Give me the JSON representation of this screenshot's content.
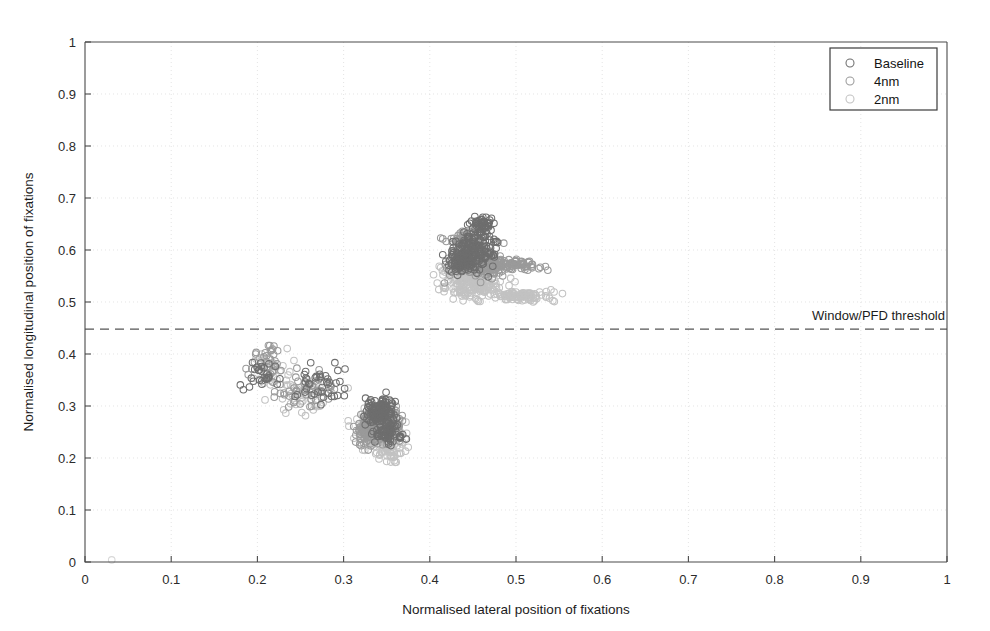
{
  "chart_data": {
    "type": "scatter",
    "title": "",
    "xlabel": "Normalised lateral position of fixations",
    "ylabel": "Normalised longitudinal position of fixations",
    "xlim": [
      0,
      1
    ],
    "ylim": [
      0,
      1
    ],
    "xticks": [
      "0",
      "0.1",
      "0.2",
      "0.3",
      "0.4",
      "0.5",
      "0.6",
      "0.7",
      "0.8",
      "0.9",
      "1"
    ],
    "yticks": [
      "0",
      "0.1",
      "0.2",
      "0.3",
      "0.4",
      "0.5",
      "0.6",
      "0.7",
      "0.8",
      "0.9",
      "1"
    ],
    "grid": true,
    "legend_position": "top-right",
    "marker": "open-circle",
    "annotations": [
      {
        "name": "window-pfd-threshold",
        "label": "Window/PFD threshold",
        "type": "horizontal-dashed-line",
        "y": 0.448,
        "label_align": "right"
      }
    ],
    "series": [
      {
        "name": "Baseline",
        "color": "#6e6e6e",
        "clusters": [
          {
            "cx": 0.452,
            "cy": 0.605,
            "sx": 0.022,
            "sy": 0.03,
            "n": 150
          },
          {
            "cx": 0.437,
            "cy": 0.575,
            "sx": 0.015,
            "sy": 0.016,
            "n": 70
          },
          {
            "cx": 0.462,
            "cy": 0.648,
            "sx": 0.012,
            "sy": 0.014,
            "n": 45
          },
          {
            "cx": 0.345,
            "cy": 0.285,
            "sx": 0.016,
            "sy": 0.026,
            "n": 130
          },
          {
            "cx": 0.352,
            "cy": 0.245,
            "sx": 0.013,
            "sy": 0.02,
            "n": 60
          },
          {
            "cx": 0.275,
            "cy": 0.345,
            "sx": 0.03,
            "sy": 0.03,
            "n": 40
          },
          {
            "cx": 0.205,
            "cy": 0.36,
            "sx": 0.018,
            "sy": 0.028,
            "n": 28
          }
        ]
      },
      {
        "name": "4nm",
        "color": "#9a9a9a",
        "clusters": [
          {
            "cx": 0.455,
            "cy": 0.575,
            "sx": 0.028,
            "sy": 0.022,
            "n": 170
          },
          {
            "cx": 0.492,
            "cy": 0.572,
            "sx": 0.03,
            "sy": 0.009,
            "n": 80
          },
          {
            "cx": 0.443,
            "cy": 0.615,
            "sx": 0.018,
            "sy": 0.022,
            "n": 70
          },
          {
            "cx": 0.343,
            "cy": 0.268,
            "sx": 0.02,
            "sy": 0.028,
            "n": 150
          },
          {
            "cx": 0.33,
            "cy": 0.25,
            "sx": 0.016,
            "sy": 0.022,
            "n": 70
          },
          {
            "cx": 0.255,
            "cy": 0.33,
            "sx": 0.035,
            "sy": 0.035,
            "n": 45
          },
          {
            "cx": 0.215,
            "cy": 0.39,
            "sx": 0.02,
            "sy": 0.035,
            "n": 30
          }
        ]
      },
      {
        "name": "2nm",
        "color": "#c2c2c2",
        "clusters": [
          {
            "cx": 0.452,
            "cy": 0.53,
            "sx": 0.03,
            "sy": 0.02,
            "n": 150
          },
          {
            "cx": 0.505,
            "cy": 0.512,
            "sx": 0.03,
            "sy": 0.01,
            "n": 90
          },
          {
            "cx": 0.44,
            "cy": 0.56,
            "sx": 0.022,
            "sy": 0.018,
            "n": 70
          },
          {
            "cx": 0.34,
            "cy": 0.255,
            "sx": 0.022,
            "sy": 0.03,
            "n": 140
          },
          {
            "cx": 0.352,
            "cy": 0.215,
            "sx": 0.016,
            "sy": 0.022,
            "n": 60
          },
          {
            "cx": 0.25,
            "cy": 0.32,
            "sx": 0.035,
            "sy": 0.035,
            "n": 45
          },
          {
            "cx": 0.215,
            "cy": 0.37,
            "sx": 0.022,
            "sy": 0.032,
            "n": 30
          }
        ]
      }
    ],
    "legend_entries": [
      {
        "label": "Baseline",
        "color": "#6e6e6e"
      },
      {
        "label": "4nm",
        "color": "#9a9a9a"
      },
      {
        "label": "2nm",
        "color": "#c2c2c2"
      }
    ]
  }
}
